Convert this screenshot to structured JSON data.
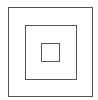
{
  "diagram": {
    "type": "concentric-squares",
    "stroke_color": "#555555",
    "background": "#ffffff",
    "squares": [
      {
        "name": "outer",
        "x": 8,
        "y": 7,
        "w": 85,
        "h": 90
      },
      {
        "name": "middle",
        "x": 25,
        "y": 25,
        "w": 52,
        "h": 55
      },
      {
        "name": "inner",
        "x": 41,
        "y": 43,
        "w": 19,
        "h": 19
      }
    ]
  }
}
